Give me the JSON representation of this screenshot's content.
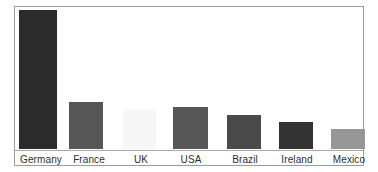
{
  "chart_data": {
    "type": "bar",
    "title": "",
    "subtitle": "",
    "xlabel": "",
    "ylabel": "",
    "categories": [
      "Germany",
      "France",
      "UK",
      "USA",
      "Brazil",
      "Ireland",
      "Mexico"
    ],
    "values": [
      139,
      47,
      40,
      42,
      34,
      27,
      20
    ],
    "ylim": [
      0,
      139
    ],
    "grid": false,
    "legend": false,
    "legend_position": "none",
    "axis_tick_labels": [
      "Germany",
      "France",
      "UK",
      "USA",
      "Brazil",
      "Ireland",
      "Mexico"
    ],
    "annotations": [],
    "bar_colors": [
      "#2b2b2b",
      "#565656",
      "#f7f7f7",
      "#565656",
      "#4a4a4a",
      "#333333",
      "#969696"
    ],
    "bars": [
      {
        "category": "Germany",
        "value": 139,
        "color": "#2b2b2b",
        "left": 4,
        "width": 38
      },
      {
        "category": "France",
        "value": 47,
        "color": "#565656",
        "left": 54,
        "width": 34
      },
      {
        "category": "UK",
        "value": 40,
        "color": "#f7f7f7",
        "left": 108,
        "width": 33
      },
      {
        "category": "USA",
        "value": 42,
        "color": "#565656",
        "left": 158,
        "width": 35
      },
      {
        "category": "Brazil",
        "value": 34,
        "color": "#4a4a4a",
        "left": 212,
        "width": 34
      },
      {
        "category": "Ireland",
        "value": 27,
        "color": "#333333",
        "left": 264,
        "width": 34
      },
      {
        "category": "Mexico",
        "value": 20,
        "color": "#969696",
        "left": 316,
        "width": 34
      }
    ],
    "labels": [
      {
        "text": "Germany",
        "left": 0,
        "width": 52
      },
      {
        "text": "France",
        "left": 50,
        "width": 48
      },
      {
        "text": "UK",
        "left": 104,
        "width": 44
      },
      {
        "text": "USA",
        "left": 152,
        "width": 48
      },
      {
        "text": "Brazil",
        "left": 206,
        "width": 48
      },
      {
        "text": "Ireland",
        "left": 258,
        "width": 48
      },
      {
        "text": "Mexico",
        "left": 310,
        "width": 48
      }
    ]
  },
  "style": {
    "background": "#ffffff",
    "frame_border_color": "#9a9a9a",
    "baseline_color": "#a8a8a8",
    "label_text_color": "#2e2e2e"
  }
}
